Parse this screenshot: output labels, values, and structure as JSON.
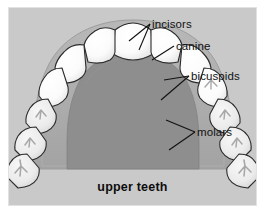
{
  "figure": {
    "title": "upper teeth",
    "caption": "upper teeth",
    "type": "anatomical-diagram",
    "style": "grayscale line drawing",
    "colors": {
      "page_background": "#ffffff",
      "plate_background": "#c9c9c9",
      "plate_border": "#e2e2e2",
      "palate": "#8e8e8e",
      "gum": "#b0b0b0",
      "gum_shadow": "#9a9a9a",
      "tooth_front": "#fdfdfd",
      "tooth_back": "#e6e6e6",
      "tooth_outline": "#2b2b2b",
      "cusp_groove": "#a8a8a8",
      "leader_line": "#111111",
      "text": "#111111"
    }
  },
  "labels": [
    {
      "id": "incisors",
      "text": "incisors",
      "points_to": "central and lateral incisors at front of arch",
      "leader": "single"
    },
    {
      "id": "canine",
      "text": "canine",
      "points_to": "canine (cuspid) at arch corner",
      "leader": "single"
    },
    {
      "id": "bicuspids",
      "text": "bicuspids",
      "points_to": "first and second premolars",
      "leader": "forked"
    },
    {
      "id": "molars",
      "text": "molars",
      "points_to": "first and second molars",
      "leader": "forked"
    }
  ],
  "teeth": {
    "total_drawn": 16,
    "arch_sides": [
      "left",
      "right"
    ],
    "groups": [
      {
        "name": "incisors",
        "count": 4,
        "shape": "flat broad crowns",
        "shade": "bright white"
      },
      {
        "name": "canine",
        "count": 2,
        "shape": "pointed crown",
        "shade": "bright white"
      },
      {
        "name": "bicuspids",
        "count": 4,
        "shape": "two-cusp crowns",
        "shade": "white with grooves"
      },
      {
        "name": "molars",
        "count": 6,
        "shape": "broad four-cusp crowns with X grooves",
        "shade": "off white with grooves"
      }
    ]
  }
}
